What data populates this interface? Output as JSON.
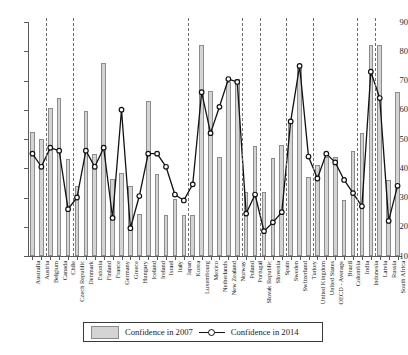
{
  "chart_data": {
    "type": "bar",
    "title": "",
    "xlabel": "",
    "ylabel": "",
    "ylim": [
      10,
      90
    ],
    "yticks": [
      10,
      20,
      30,
      40,
      50,
      60,
      70,
      80,
      90
    ],
    "grid": false,
    "legend_position": "bottom",
    "categories": [
      "Australia",
      "Austria",
      "Belgium",
      "Canada",
      "Chile",
      "Czech Republic",
      "Denmark",
      "Estonia",
      "Finland",
      "France",
      "Germany",
      "Greece",
      "Hungary",
      "Iceland",
      "Ireland",
      "Israel",
      "Italy",
      "Japan",
      "Korea",
      "Luxembourg",
      "Mexico",
      "Netherlands",
      "New Zealand",
      "Norway",
      "Poland",
      "Portugal",
      "Slovak Republic",
      "Slovenia",
      "Spain",
      "Sweden",
      "Switzerland",
      "Turkey",
      "United Kingdom",
      "United States",
      "OECD - Average",
      "Brazil",
      "Colombia",
      "India",
      "Indonesia",
      "Latvia",
      "Russia",
      "South Africa"
    ],
    "series": [
      {
        "name": "Confidence in 2007",
        "type": "bar",
        "values": [
          52.5,
          50,
          60.5,
          64,
          43,
          34,
          59.5,
          45,
          76,
          36.5,
          38.5,
          34,
          24.5,
          63,
          38,
          24,
          29.5,
          24,
          24,
          82,
          66.5,
          44,
          69.5,
          70.5,
          32,
          47.5,
          32,
          43.5,
          48,
          56.5,
          75,
          37,
          41,
          44,
          44,
          29,
          46,
          52,
          82,
          82,
          36,
          66
        ]
      },
      {
        "name": "Confidence in 2014",
        "type": "line",
        "values": [
          45,
          40.5,
          47,
          46,
          26,
          30,
          46,
          40.5,
          47,
          23,
          60,
          19.5,
          30.5,
          45,
          45,
          40.5,
          31,
          29,
          34.5,
          66,
          52,
          61,
          70.5,
          69.5,
          24.5,
          31,
          18.5,
          21.5,
          25,
          56,
          75,
          44,
          36.5,
          45,
          42,
          36,
          31.5,
          27,
          73,
          64,
          22,
          34
        ]
      }
    ],
    "separators_after": [
      "Austria",
      "Chile",
      "Japan",
      "Norway",
      "Portugal",
      "Spain",
      "Turkey",
      "Colombia",
      "Indonesia"
    ]
  },
  "legend": {
    "bars_label": "Confidence in 2007",
    "line_label": "Confidence in 2014"
  },
  "caption": ""
}
